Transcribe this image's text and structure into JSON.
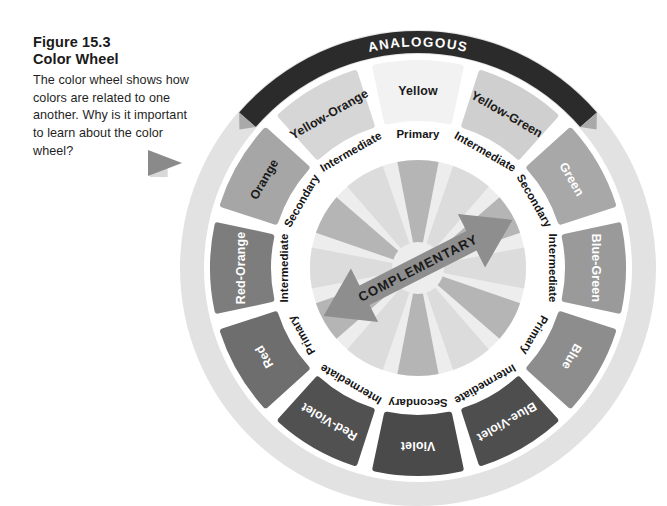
{
  "caption": {
    "figure_number": "Figure 15.3",
    "figure_title": "Color Wheel",
    "body": "The color wheel shows how colors are related to one another. Why is it important to learn about the color wheel?"
  },
  "diagram": {
    "band_label": "ANALOGOUS",
    "arrow_label": "COMPLEMENTARY",
    "center": {
      "x": 418,
      "y": 268
    },
    "radii": {
      "outer_ring_outer": 238,
      "outer_ring_inner": 214,
      "segment_outer": 205,
      "segment_inner": 150,
      "ring_label_outer": 147,
      "ring_label_inner": 110,
      "hub_outer": 108
    },
    "band": {
      "radius": 226,
      "thickness": 22,
      "start_angle_deg": -139,
      "end_angle_deg": -41,
      "color": "#2b2b2b"
    },
    "colors": {
      "page_background": "#ffffff",
      "outer_ring": "#e2e2e2",
      "gap": "#ffffff",
      "hub_light": "#ededed",
      "hub_mid": "#b5b5b5",
      "hub_pale": "#dcdcdc",
      "arrow_fill": "#8e8e8e",
      "pointer": "#8a8a8a",
      "pointer_shadow": "#d8d8d8"
    },
    "segments": [
      {
        "name": "Yellow",
        "angle_deg": 0,
        "fill": "#f2f2f2",
        "text": "#1a1a1a",
        "ring_label": "Primary"
      },
      {
        "name": "Yellow-Green",
        "angle_deg": 30,
        "fill": "#cfcfcf",
        "text": "#1a1a1a",
        "ring_label": "Intermediate"
      },
      {
        "name": "Green",
        "angle_deg": 60,
        "fill": "#a8a8a8",
        "text": "#ffffff",
        "ring_label": "Secondary"
      },
      {
        "name": "Blue-Green",
        "angle_deg": 90,
        "fill": "#9a9a9a",
        "text": "#ffffff",
        "ring_label": "Intermediate"
      },
      {
        "name": "Blue",
        "angle_deg": 120,
        "fill": "#8d8d8d",
        "text": "#ffffff",
        "ring_label": "Primary"
      },
      {
        "name": "Blue-Violet",
        "angle_deg": 150,
        "fill": "#4e4e4e",
        "text": "#ffffff",
        "ring_label": "Intermediate"
      },
      {
        "name": "Violet",
        "angle_deg": 180,
        "fill": "#4a4a4a",
        "text": "#ffffff",
        "ring_label": "Secondary"
      },
      {
        "name": "Red-Violet",
        "angle_deg": 210,
        "fill": "#515151",
        "text": "#ffffff",
        "ring_label": "Intermediate"
      },
      {
        "name": "Red",
        "angle_deg": 240,
        "fill": "#6e6e6e",
        "text": "#ffffff",
        "ring_label": "Primary"
      },
      {
        "name": "Red-Orange",
        "angle_deg": 270,
        "fill": "#7d7d7d",
        "text": "#ffffff",
        "ring_label": "Intermediate"
      },
      {
        "name": "Orange",
        "angle_deg": 300,
        "fill": "#a6a6a6",
        "text": "#1a1a1a",
        "ring_label": "Secondary"
      },
      {
        "name": "Yellow-Orange",
        "angle_deg": 330,
        "fill": "#d6d6d6",
        "text": "#1a1a1a",
        "ring_label": "Intermediate"
      }
    ],
    "complementary_arrow": {
      "angle_deg": -27,
      "length": 212,
      "shaft_half_width": 11,
      "head_half_width": 30,
      "head_length": 46
    },
    "pointer": {
      "x": 148,
      "y": 150,
      "width": 34,
      "height": 26
    }
  }
}
